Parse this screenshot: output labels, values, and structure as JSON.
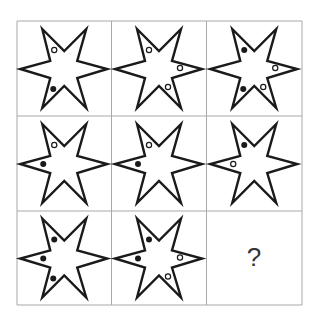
{
  "puzzle": {
    "grid": {
      "rows": 3,
      "cols": 3,
      "x_edges": [
        17,
        111.5,
        206.5,
        302
      ],
      "y_edges": [
        21,
        116,
        211,
        305
      ]
    },
    "shape": "six-pointed-star",
    "positions_legend": {
      "UL": "upper-left arm",
      "L": "left arm",
      "LL": "lower-left arm",
      "R": "right arm",
      "LR": "lower-right arm"
    },
    "cells": [
      {
        "row": 1,
        "col": 1,
        "circles": [
          {
            "pos": "UL",
            "fill": "open"
          },
          {
            "pos": "LL",
            "fill": "filled"
          }
        ]
      },
      {
        "row": 1,
        "col": 2,
        "circles": [
          {
            "pos": "UL",
            "fill": "open"
          },
          {
            "pos": "R",
            "fill": "open"
          },
          {
            "pos": "LR",
            "fill": "open"
          }
        ]
      },
      {
        "row": 1,
        "col": 3,
        "circles": [
          {
            "pos": "UL",
            "fill": "filled"
          },
          {
            "pos": "R",
            "fill": "open"
          },
          {
            "pos": "LL",
            "fill": "filled"
          },
          {
            "pos": "LR",
            "fill": "open"
          }
        ]
      },
      {
        "row": 2,
        "col": 1,
        "circles": [
          {
            "pos": "UL",
            "fill": "open"
          },
          {
            "pos": "L",
            "fill": "filled"
          }
        ]
      },
      {
        "row": 2,
        "col": 2,
        "circles": [
          {
            "pos": "UL",
            "fill": "open"
          },
          {
            "pos": "L",
            "fill": "filled"
          }
        ]
      },
      {
        "row": 2,
        "col": 3,
        "circles": [
          {
            "pos": "UL",
            "fill": "filled"
          },
          {
            "pos": "L",
            "fill": "open"
          }
        ]
      },
      {
        "row": 3,
        "col": 1,
        "circles": [
          {
            "pos": "UL",
            "fill": "filled"
          },
          {
            "pos": "L",
            "fill": "filled"
          },
          {
            "pos": "LL",
            "fill": "filled"
          }
        ]
      },
      {
        "row": 3,
        "col": 2,
        "circles": [
          {
            "pos": "UL",
            "fill": "filled"
          },
          {
            "pos": "L",
            "fill": "filled"
          },
          {
            "pos": "R",
            "fill": "open"
          },
          {
            "pos": "LR",
            "fill": "open"
          }
        ]
      },
      {
        "row": 3,
        "col": 3,
        "missing": true,
        "label": "?"
      }
    ]
  },
  "colors": {
    "grid": "#a8a8a8",
    "outline": "#1a1a1a",
    "question_mark": "#333333"
  }
}
